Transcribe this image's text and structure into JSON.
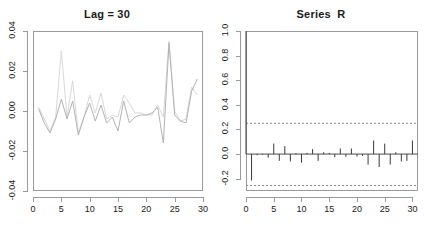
{
  "figure": {
    "background": "#ffffff",
    "frame_color": "#9a9a9a",
    "text_color": "#1a1a1a"
  },
  "chart_data": [
    {
      "type": "line",
      "panel": "left",
      "title": "Lag = 30",
      "xlabel": "",
      "ylabel": "",
      "xlim": [
        0,
        30
      ],
      "ylim": [
        -0.04,
        0.04
      ],
      "xticks": [
        0,
        5,
        10,
        15,
        20,
        25,
        30
      ],
      "yticks": [
        -0.04,
        -0.02,
        0.0,
        0.02,
        0.04
      ],
      "xtick_labels": [
        "0",
        "5",
        "10",
        "15",
        "20",
        "25",
        "30"
      ],
      "ytick_labels": [
        "-0.04",
        "-0.02",
        "0.00",
        "0.02",
        "0.04"
      ],
      "grid": false,
      "legend": "none",
      "x": [
        1,
        2,
        3,
        4,
        5,
        6,
        7,
        8,
        9,
        10,
        11,
        12,
        13,
        14,
        15,
        16,
        17,
        18,
        19,
        20,
        21,
        22,
        23,
        24,
        25,
        26,
        27,
        28,
        29
      ],
      "series": [
        {
          "name": "series-light",
          "color": "#d9d9d9",
          "values": [
            0.002,
            -0.004,
            -0.01,
            -0.003,
            0.03,
            -0.003,
            0.015,
            -0.011,
            -0.003,
            0.008,
            -0.001,
            0.009,
            -0.004,
            -0.002,
            -0.003,
            0.008,
            0.004,
            -0.001,
            -0.001,
            -0.002,
            -0.002,
            0.003,
            -0.003,
            0.035,
            0.0,
            -0.005,
            -0.004,
            0.012,
            0.008
          ]
        },
        {
          "name": "series-dark",
          "color": "#b3b3b3",
          "values": [
            0.001,
            -0.006,
            -0.011,
            -0.004,
            0.006,
            -0.004,
            0.005,
            -0.012,
            -0.003,
            0.004,
            -0.005,
            0.003,
            -0.006,
            -0.003,
            -0.01,
            0.005,
            -0.006,
            -0.003,
            -0.002,
            -0.002,
            -0.001,
            0.002,
            -0.016,
            0.034,
            -0.002,
            -0.005,
            -0.006,
            0.01,
            0.016
          ]
        }
      ]
    },
    {
      "type": "bar",
      "panel": "right",
      "title": "Series  R",
      "xlabel": "",
      "ylabel": "",
      "xlim": [
        0,
        31
      ],
      "ylim": [
        -0.3,
        1.0
      ],
      "xticks": [
        0,
        5,
        10,
        15,
        20,
        25,
        30
      ],
      "yticks": [
        -0.2,
        0.0,
        0.2,
        0.4,
        0.6,
        0.8,
        1.0
      ],
      "xtick_labels": [
        "0",
        "5",
        "10",
        "15",
        "20",
        "25",
        "30"
      ],
      "ytick_labels": [
        "-0.2",
        "0.0",
        "0.2",
        "0.4",
        "0.6",
        "0.8",
        "1.0"
      ],
      "grid": false,
      "legend": "none",
      "bar_color": "#3a3a3a",
      "confidence_bands": {
        "upper": 0.25,
        "lower": -0.255,
        "color": "#8c8c8c",
        "style": "dashed"
      },
      "categories": [
        0,
        1,
        2,
        3,
        4,
        5,
        6,
        7,
        8,
        9,
        10,
        11,
        12,
        13,
        14,
        15,
        16,
        17,
        18,
        19,
        20,
        21,
        22,
        23,
        24,
        25,
        26,
        27,
        28,
        29,
        30
      ],
      "values": [
        1.0,
        -0.215,
        -0.01,
        -0.005,
        -0.03,
        0.085,
        -0.055,
        0.065,
        -0.06,
        0.008,
        -0.07,
        0.01,
        0.04,
        -0.055,
        0.015,
        0.01,
        -0.025,
        0.045,
        -0.022,
        0.045,
        -0.02,
        -0.015,
        -0.085,
        0.11,
        -0.105,
        0.085,
        -0.085,
        0.015,
        -0.06,
        -0.055,
        0.11
      ]
    }
  ]
}
